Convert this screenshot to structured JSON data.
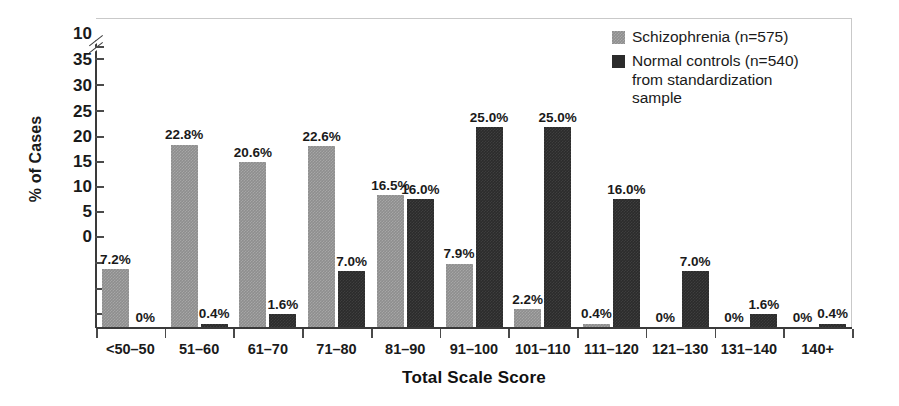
{
  "chart_data": {
    "type": "bar",
    "title": "",
    "xlabel": "Total Scale Score",
    "ylabel": "% of Cases",
    "categories": [
      "<50–50",
      "51–60",
      "61–70",
      "71–80",
      "81–90",
      "91–100",
      "101–110",
      "111–120",
      "121–130",
      "131–140",
      "140+"
    ],
    "series": [
      {
        "name": "Schizophrenia (n=575)",
        "color": "#8e8e8e",
        "values": [
          7.2,
          22.8,
          20.6,
          22.6,
          16.5,
          7.9,
          2.2,
          0.4,
          0,
          0,
          0
        ],
        "labels": [
          "7.2%",
          "22.8%",
          "20.6%",
          "22.6%",
          "16.5%",
          "7.9%",
          "2.2%",
          "0.4%",
          "0%",
          "0%",
          "0%"
        ]
      },
      {
        "name": "Normal controls (n=540) from standardization sample",
        "color": "#2b2b2b",
        "values": [
          0,
          0.4,
          1.6,
          7.0,
          16.0,
          25.0,
          25.0,
          16.0,
          7.0,
          1.6,
          0.4
        ],
        "labels": [
          "0%",
          "0.4%",
          "1.6%",
          "7.0%",
          "16.0%",
          "25.0%",
          "25.0%",
          "16.0%",
          "7.0%",
          "1.6%",
          "0.4%"
        ]
      }
    ],
    "yticks": [
      "10",
      "35",
      "30",
      "25",
      "20",
      "15",
      "10",
      "5",
      "0"
    ],
    "ylim": [
      0,
      25
    ],
    "axis_break": true,
    "grid": false,
    "legend_position": "top-right"
  },
  "axis": {
    "y_label": "% of Cases",
    "x_title": "Total Scale Score"
  },
  "legend": {
    "entries": [
      {
        "label": "Schizophrenia (n=575)",
        "swatch": "a"
      },
      {
        "label": "Normal controls (n=540)\nfrom standardization\nsample",
        "swatch": "b"
      }
    ],
    "entry_1_label": "Schizophrenia (n=575)",
    "entry_2_line_1": "Normal controls (n=540)",
    "entry_2_line_2": "from standardization",
    "entry_2_line_3": "sample"
  }
}
